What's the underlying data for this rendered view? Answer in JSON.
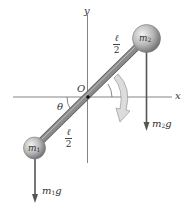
{
  "diagram": {
    "type": "physics-free-body",
    "axes": {
      "x_label": "x",
      "y_label": "y"
    },
    "origin_label": "O",
    "angle_label": "θ",
    "half_length": {
      "numerator": "ℓ",
      "denominator": "2"
    },
    "masses": {
      "m1": {
        "label": "m",
        "sub": "1"
      },
      "m2": {
        "label": "m",
        "sub": "2"
      }
    },
    "forces": {
      "m1g": {
        "label": "m",
        "sub": "1",
        "suffix": "g"
      },
      "m2g": {
        "label": "m",
        "sub": "2",
        "suffix": "g"
      }
    },
    "rotation": "clockwise",
    "colors": {
      "axis": "#555555",
      "rod": "#8a8a8a",
      "ball": "#b5b5b5",
      "arrow": "#555555",
      "rotation_arrow": "#d6d6d6"
    }
  }
}
